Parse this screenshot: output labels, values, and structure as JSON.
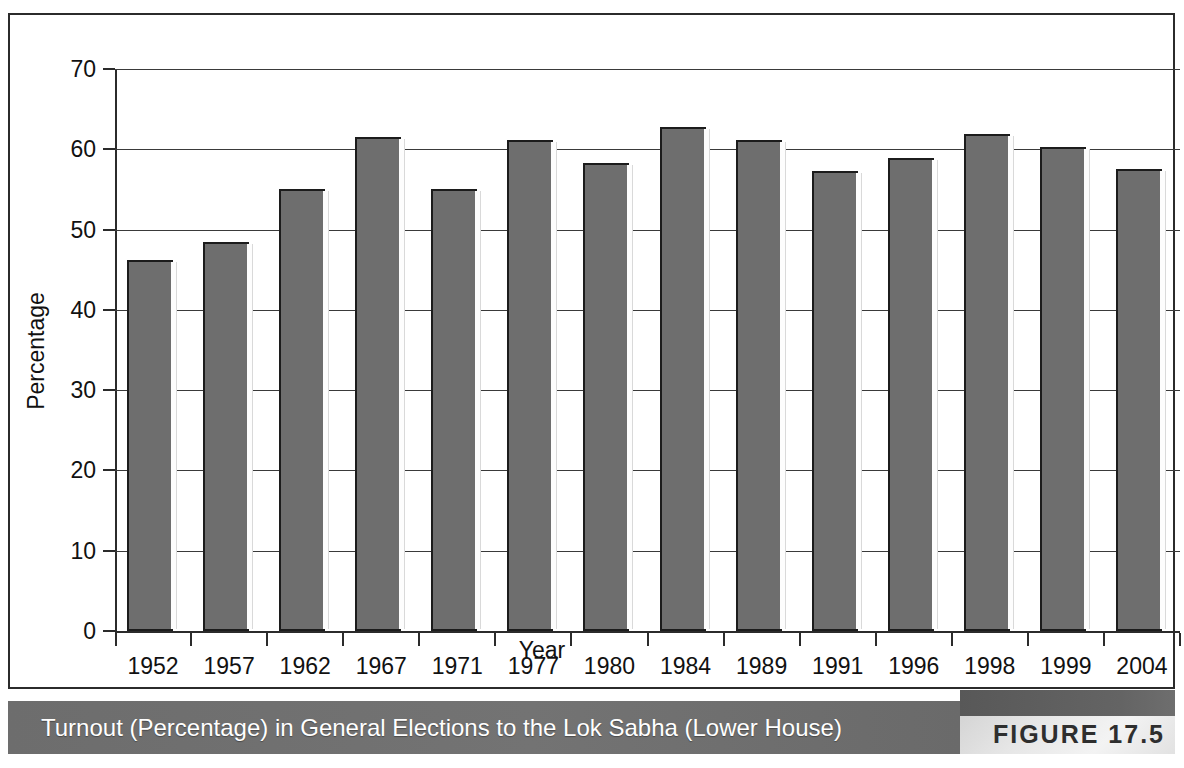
{
  "figure": {
    "caption": "Turnout (Percentage) in General Elections to the Lok Sabha (Lower House)",
    "label": "FIGURE 17.5"
  },
  "colors": {
    "bar_fill": "#6e6e6e",
    "bar_outline": "#1c1c1c",
    "caption_band": "#6b6b6b",
    "caption_text": "#ffffff",
    "figure_label": "#2e2e2e",
    "axis": "#2b2b2b",
    "plot_background": "#ffffff"
  },
  "chart_data": {
    "type": "bar",
    "title": "Turnout (Percentage) in General Elections to the Lok Sabha (Lower House)",
    "xlabel": "Year",
    "ylabel": "Percentage",
    "ylim": [
      0,
      70
    ],
    "yticks": [
      0,
      10,
      20,
      30,
      40,
      50,
      60,
      70
    ],
    "grid": true,
    "legend": "none",
    "categories": [
      "1952",
      "1957",
      "1962",
      "1967",
      "1971",
      "1977",
      "1980",
      "1984",
      "1989",
      "1991",
      "1996",
      "1998",
      "1999",
      "2004"
    ],
    "values": [
      46.2,
      48.5,
      55.1,
      61.5,
      55.1,
      61.2,
      58.3,
      62.8,
      61.2,
      57.3,
      58.9,
      61.9,
      60.3,
      57.6
    ]
  }
}
